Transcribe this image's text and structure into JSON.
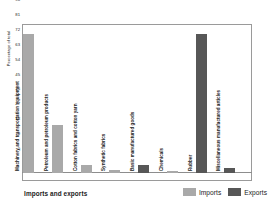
{
  "chart_data": {
    "type": "bar",
    "title": "",
    "xlabel": "Imports and exports",
    "ylabel": "Percentage of total",
    "ylim": [
      0,
      90
    ],
    "yticks": [
      90,
      81,
      72,
      63,
      54,
      45,
      36,
      27,
      18,
      9,
      0
    ],
    "grid": false,
    "legend_position": "bottom-right",
    "categories": [
      "Machinery and transportation equipment",
      "Petroleum and petroleum products",
      "Cotton fabrics and cotton yarn",
      "Synthetic fabrics",
      "Basic manufactured goods",
      "Chemicals",
      "Rubber",
      "Miscellaneous manufactured articles"
    ],
    "bars": [
      {
        "label": "Machinery and transportation equipment",
        "series": "Imports",
        "value": 84
      },
      {
        "label": "Petroleum and petroleum products",
        "series": "Imports",
        "value": 29
      },
      {
        "label": "Cotton fabrics and cotton yarn",
        "series": "Imports",
        "value": 5
      },
      {
        "label": "Synthetic fabrics",
        "series": "Imports",
        "value": 2
      },
      {
        "label": "Basic manufactured goods",
        "series": "Exports",
        "value": 5
      },
      {
        "label": "Chemicals",
        "series": "Imports",
        "value": 1
      },
      {
        "label": "Rubber",
        "series": "Exports",
        "value": 84
      },
      {
        "label": "Miscellaneous manufactured articles",
        "series": "Exports",
        "value": 3
      }
    ],
    "series": [
      {
        "name": "Imports",
        "color": "#a9a9a9",
        "values": [
          84,
          29,
          5,
          2,
          0,
          1,
          0,
          0
        ]
      },
      {
        "name": "Exports",
        "color": "#575757",
        "values": [
          0,
          0,
          0,
          0,
          5,
          0,
          84,
          3
        ]
      }
    ]
  },
  "legend": {
    "entries": [
      {
        "label": "Imports",
        "series": "imports"
      },
      {
        "label": "Exports",
        "series": "exports"
      }
    ]
  }
}
